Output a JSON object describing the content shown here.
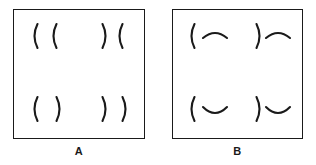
{
  "figure": {
    "background_color": "#ffffff",
    "ink_color": "#1a1a1a",
    "panel_count": 2
  },
  "panels": [
    {
      "id": "A",
      "label": "A",
      "description": "Square outline containing four quadrant groups, each made of two vertical arc strokes (parentheses).",
      "frame": {
        "x": 13,
        "y": 9,
        "width": 132,
        "height": 130,
        "border_width": 1.6
      },
      "quadrants": [
        {
          "position": "top-left",
          "name": "quadrant-top-left",
          "glyphs": [
            "(",
            "("
          ],
          "orientations": [
            "opens-right",
            "opens-right"
          ],
          "reading": "( ("
        },
        {
          "position": "top-right",
          "name": "quadrant-top-right",
          "glyphs": [
            ")",
            "("
          ],
          "orientations": [
            "opens-left",
            "opens-right"
          ],
          "reading": ") ("
        },
        {
          "position": "bottom-left",
          "name": "quadrant-bottom-left",
          "glyphs": [
            "(",
            ")"
          ],
          "orientations": [
            "opens-right",
            "opens-left"
          ],
          "reading": "( )"
        },
        {
          "position": "bottom-right",
          "name": "quadrant-bottom-right",
          "glyphs": [
            ")",
            ")"
          ],
          "orientations": [
            "opens-left",
            "opens-left"
          ],
          "reading": ") )"
        }
      ]
    },
    {
      "id": "B",
      "label": "B",
      "description": "Square outline containing four quadrant groups, each made of one vertical arc stroke plus one horizontal arc stroke.",
      "frame": {
        "x": 172,
        "y": 9,
        "width": 131,
        "height": 130,
        "border_width": 1.6
      },
      "quadrants": [
        {
          "position": "top-left",
          "name": "quadrant-top-left",
          "glyphs": [
            "(",
            "⌢"
          ],
          "orientations": [
            "opens-right",
            "opens-down"
          ],
          "reading": "( ⌢"
        },
        {
          "position": "top-right",
          "name": "quadrant-top-right",
          "glyphs": [
            ")",
            "⌢"
          ],
          "orientations": [
            "opens-left",
            "opens-down"
          ],
          "reading": ") ⌢"
        },
        {
          "position": "bottom-left",
          "name": "quadrant-bottom-left",
          "glyphs": [
            "(",
            "⌣"
          ],
          "orientations": [
            "opens-right",
            "opens-up"
          ],
          "reading": "( ⌣"
        },
        {
          "position": "bottom-right",
          "name": "quadrant-bottom-right",
          "glyphs": [
            ")",
            "⌣"
          ],
          "orientations": [
            "opens-left",
            "opens-up"
          ],
          "reading": ") ⌣"
        }
      ]
    }
  ]
}
